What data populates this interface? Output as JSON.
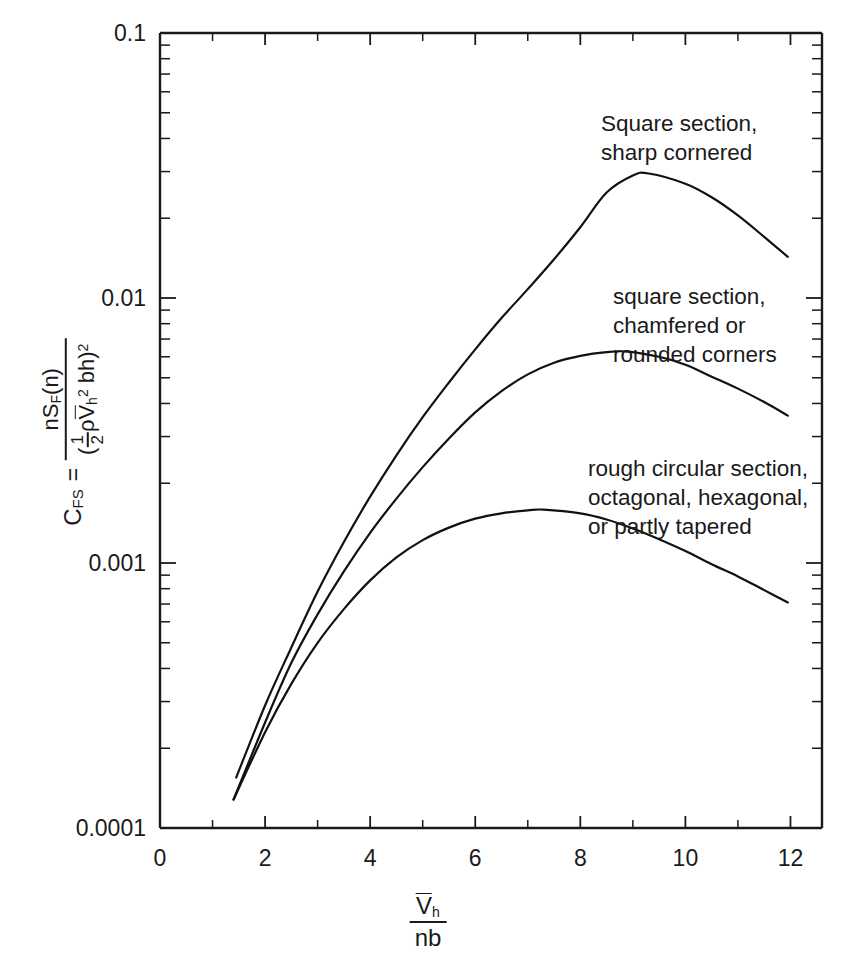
{
  "chart_data": {
    "type": "line",
    "title": "",
    "xlabel": "V̄h / nb",
    "ylabel": "C_FS = nS_F(n) / ((1/2)ρ V̄h² bh)²",
    "xscale": "linear",
    "yscale": "log",
    "xlim": [
      0,
      12.6
    ],
    "ylim": [
      0.0001,
      0.1
    ],
    "grid": false,
    "legend_position": "inline-annotations",
    "x_ticks_major": [
      0,
      2,
      4,
      6,
      8,
      10,
      12
    ],
    "x_tick_labels": [
      "0",
      "2",
      "4",
      "6",
      "8",
      "10",
      "12"
    ],
    "x_ticks_minor": [
      1,
      3,
      5,
      7,
      9,
      11
    ],
    "y_ticks_major": [
      0.1,
      0.01,
      0.001,
      0.0001
    ],
    "y_tick_labels": [
      "0.1",
      "0.01",
      "0.001",
      "0.0001"
    ],
    "series": [
      {
        "name": "Square section, sharp cornered",
        "x": [
          1.45,
          2.0,
          2.5,
          3.0,
          3.5,
          4.0,
          4.5,
          5.0,
          5.5,
          6.0,
          6.5,
          7.0,
          7.5,
          8.0,
          8.5,
          9.0,
          9.3,
          10.0,
          10.5,
          11.0,
          11.5,
          11.95
        ],
        "y": [
          0.000155,
          0.00029,
          0.00048,
          0.00078,
          0.0012,
          0.00178,
          0.00255,
          0.00355,
          0.0048,
          0.0064,
          0.0084,
          0.0108,
          0.014,
          0.0185,
          0.025,
          0.029,
          0.0295,
          0.027,
          0.024,
          0.0205,
          0.017,
          0.0143
        ]
      },
      {
        "name": "square section, chamfered or rounded corners",
        "x": [
          1.4,
          2.0,
          2.5,
          3.0,
          3.5,
          4.0,
          4.5,
          5.0,
          5.5,
          6.0,
          6.5,
          7.0,
          7.5,
          8.0,
          8.5,
          8.9,
          9.5,
          10.0,
          10.5,
          11.0,
          11.5,
          11.95
        ],
        "y": [
          0.000128,
          0.00025,
          0.00042,
          0.00064,
          0.00093,
          0.0013,
          0.00175,
          0.0023,
          0.00295,
          0.0037,
          0.00445,
          0.00515,
          0.0057,
          0.00605,
          0.00625,
          0.00628,
          0.006,
          0.0056,
          0.00505,
          0.00455,
          0.00405,
          0.0036
        ]
      },
      {
        "name": "rough circular section, octagonal, hexagonal, or partly tapered",
        "x": [
          1.4,
          2.0,
          2.5,
          3.0,
          3.5,
          4.0,
          4.5,
          5.0,
          5.5,
          6.0,
          6.5,
          7.0,
          7.3,
          8.0,
          8.5,
          9.0,
          9.5,
          10.0,
          10.5,
          11.0,
          11.5,
          11.95
        ],
        "y": [
          0.000128,
          0.00023,
          0.00035,
          0.0005,
          0.00067,
          0.00086,
          0.00105,
          0.00122,
          0.00136,
          0.00147,
          0.00154,
          0.00158,
          0.00159,
          0.00154,
          0.00146,
          0.00135,
          0.00123,
          0.00111,
          0.00099,
          0.00089,
          0.00079,
          0.00071
        ]
      }
    ],
    "annotations": [
      {
        "lines": "Square section,\nsharp cornered"
      },
      {
        "lines": "square section,\nchamfered or\nrounded corners"
      },
      {
        "lines": "rough circular section,\noctagonal, hexagonal,\nor partly tapered"
      }
    ]
  },
  "ylabel_parts": {
    "symbol": "C",
    "symbol_sub": "FS",
    "equals": "=",
    "numerator": "nS",
    "numerator_sub": "F",
    "numerator_tail": "(n)",
    "den_open": "(",
    "den_frac_num": "1",
    "den_frac_den": "2",
    "den_rho": "ρ",
    "den_v": "V",
    "den_v_sub": "h",
    "den_v_sup": "2",
    "den_bh": "bh)",
    "den_sup": "2"
  },
  "xlabel_parts": {
    "numerator": "V",
    "numerator_sub": "h",
    "denominator": "nb"
  }
}
